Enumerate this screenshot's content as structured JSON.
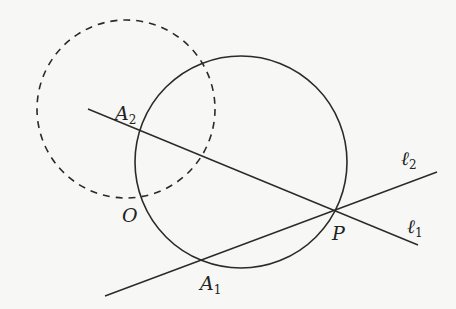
{
  "diagram": {
    "background": "#f7f7f5",
    "stroke": "#2a2a2a",
    "solid_circle": {
      "cx": 241,
      "cy": 162,
      "r": 106
    },
    "dashed_circle": {
      "cx": 126,
      "cy": 109,
      "r": 89
    },
    "lines": [
      {
        "name": "l1",
        "x1": 88,
        "y1": 109,
        "x2": 418,
        "y2": 245
      },
      {
        "name": "l2",
        "x1": 105,
        "y1": 296,
        "x2": 437,
        "y2": 172
      }
    ],
    "labels": {
      "A2": {
        "main": "A",
        "sub": "2",
        "x": 115,
        "y": 120
      },
      "O": {
        "main": "O",
        "x": 122,
        "y": 222
      },
      "A1": {
        "main": "A",
        "sub": "1",
        "x": 200,
        "y": 290
      },
      "P": {
        "main": "P",
        "x": 332,
        "y": 240
      },
      "l2": {
        "main": "ℓ",
        "sub": "2",
        "x": 401,
        "y": 165
      },
      "l1": {
        "main": "ℓ",
        "sub": "1",
        "x": 407,
        "y": 233
      }
    }
  }
}
